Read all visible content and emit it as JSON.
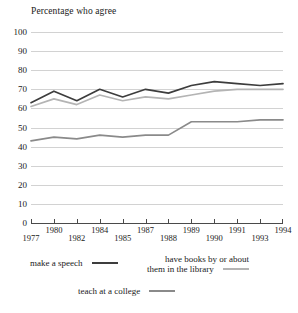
{
  "chart_data": {
    "type": "line",
    "title": "Percentage who agree",
    "xlabel": "",
    "ylabel": "",
    "ylim": [
      0,
      100
    ],
    "ytick_step": 10,
    "yticks": [
      "100",
      "90",
      "80",
      "70",
      "60",
      "50",
      "40",
      "30",
      "20",
      "10",
      "0"
    ],
    "grid": true,
    "legend_position": "below",
    "categories": [
      "1977",
      "1980",
      "1982",
      "1984",
      "1985",
      "1987",
      "1988",
      "1989",
      "1990",
      "1991",
      "1993",
      "1994"
    ],
    "series": [
      {
        "name": "make a speech",
        "color": "#3d3d3d",
        "values": [
          63,
          69,
          64,
          70,
          66,
          70,
          68,
          72,
          74,
          73,
          72,
          73
        ]
      },
      {
        "name": "have books by or about them in the library",
        "color": "#b4b4b4",
        "values": [
          61,
          65,
          62,
          67,
          64,
          66,
          65,
          67,
          69,
          70,
          70,
          70
        ]
      },
      {
        "name": "teach at a college",
        "color": "#8a8a8a",
        "values": [
          43,
          45,
          44,
          46,
          45,
          46,
          46,
          53,
          53,
          53,
          54,
          54
        ]
      }
    ]
  },
  "legend": {
    "speech_label": "make a speech",
    "books_label_line1": "have books by or about",
    "books_label_line2": "them in the library",
    "teach_label": "teach at a college"
  }
}
